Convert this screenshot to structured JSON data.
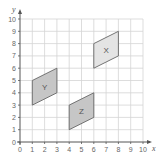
{
  "diagram": {
    "type": "coordinate-grid",
    "x_axis": {
      "label": "x",
      "min": 0,
      "max": 10,
      "ticks": [
        "0",
        "1",
        "2",
        "3",
        "4",
        "5",
        "6",
        "7",
        "8",
        "9",
        "10"
      ]
    },
    "y_axis": {
      "label": "y",
      "min": 0,
      "max": 10,
      "ticks": [
        "0",
        "1",
        "2",
        "3",
        "4",
        "5",
        "6",
        "7",
        "8",
        "9",
        "10"
      ]
    },
    "shapes": [
      {
        "label": "X",
        "vertices": [
          [
            6,
            6
          ],
          [
            6,
            8
          ],
          [
            8,
            9
          ],
          [
            8,
            7
          ]
        ],
        "fill": "#e4e4e4"
      },
      {
        "label": "Y",
        "vertices": [
          [
            1,
            3
          ],
          [
            1,
            5
          ],
          [
            3,
            6
          ],
          [
            3,
            4
          ]
        ],
        "fill": "#c6c6c6"
      },
      {
        "label": "Z",
        "vertices": [
          [
            4,
            1
          ],
          [
            4,
            3
          ],
          [
            6,
            4
          ],
          [
            6,
            2
          ]
        ],
        "fill": "#c6c6c6"
      }
    ]
  }
}
